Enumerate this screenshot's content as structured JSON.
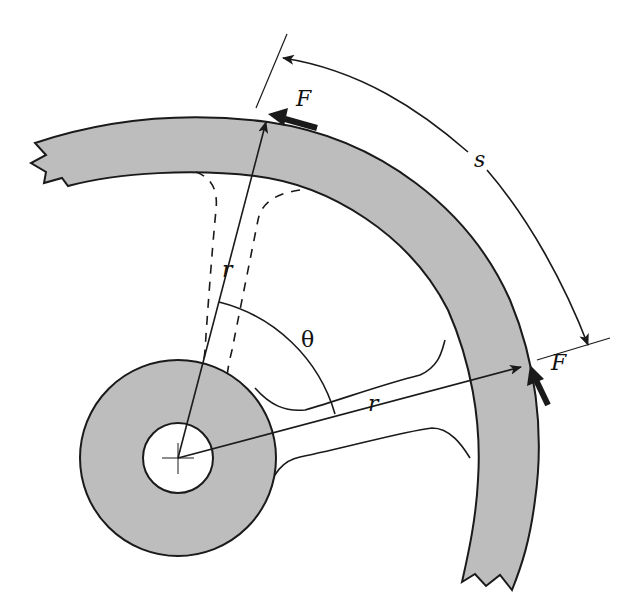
{
  "diagram": {
    "colors": {
      "fill": "#bdbdbd",
      "stroke": "#1a1a1a",
      "background": "#ffffff"
    },
    "labels": {
      "force_top": "F",
      "force_right": "F",
      "arc_length": "s",
      "angle": "θ",
      "radius_top": "r",
      "radius_right": "r"
    },
    "parts": [
      {
        "name": "rim",
        "description": "broken circular rim segment (shaded)"
      },
      {
        "name": "hub",
        "description": "annular hub with bore and center cross"
      },
      {
        "name": "spoke",
        "description": "spoke connecting hub to rim"
      },
      {
        "name": "spoke-deflected",
        "description": "dashed spoke outline (displaced position)"
      }
    ]
  }
}
